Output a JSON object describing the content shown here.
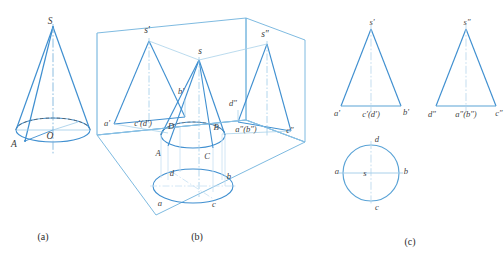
{
  "figure": {
    "colors": {
      "solid_line": "#3f8fd0",
      "light_line": "#9fcbe8",
      "very_light_line": "#c6e0f2",
      "hidden_line": "#6f6f6f",
      "axis_line": "#b9d7ec",
      "label_text": "#3a3a3a",
      "caption_text": "#2b2b2b",
      "background": "#ffffff"
    },
    "captions": [
      {
        "id": "caption-a",
        "label": "(a)",
        "x": 43,
        "y": 238
      },
      {
        "id": "caption-b",
        "label": "(b)",
        "x": 197,
        "y": 238
      },
      {
        "id": "caption-c",
        "label": "(c)",
        "x": 410,
        "y": 243
      }
    ]
  },
  "part_a": {
    "name": "pictorial-cone",
    "labels": [
      {
        "id": "apex-S",
        "text": "S",
        "x": 50,
        "y": 22
      },
      {
        "id": "center-O",
        "text": "O",
        "x": 50,
        "y": 133
      },
      {
        "id": "point-A",
        "text": "A",
        "x": 14,
        "y": 142
      }
    ]
  },
  "part_b": {
    "name": "projection-box",
    "labels": [
      {
        "id": "apex-s-prime",
        "text": "s'",
        "x": 144,
        "y": 29
      },
      {
        "id": "apex-s",
        "text": "s",
        "x": 199,
        "y": 52
      },
      {
        "id": "apex-s-double-prime",
        "text": "s″",
        "x": 262,
        "y": 34
      },
      {
        "id": "label-b-prime",
        "text": "b'",
        "x": 181,
        "y": 92
      },
      {
        "id": "label-d-double-prime",
        "text": "d″",
        "x": 231,
        "y": 103
      },
      {
        "id": "label-a-prime",
        "text": "a'",
        "x": 107,
        "y": 124
      },
      {
        "id": "label-c-prime-d-prime",
        "text": "c'(d')",
        "x": 140,
        "y": 124
      },
      {
        "id": "label-D",
        "text": "D",
        "x": 171,
        "y": 127
      },
      {
        "id": "label-B",
        "text": "B",
        "x": 216,
        "y": 128
      },
      {
        "id": "label-a-dp-b-dp",
        "text": "a″(b″)",
        "x": 228,
        "y": 130
      },
      {
        "id": "label-c-double-prime",
        "text": "c″",
        "x": 287,
        "y": 130
      },
      {
        "id": "label-A",
        "text": "A",
        "x": 158,
        "y": 153
      },
      {
        "id": "label-C",
        "text": "C",
        "x": 206,
        "y": 156
      },
      {
        "id": "label-d",
        "text": "d",
        "x": 172,
        "y": 174
      },
      {
        "id": "label-b",
        "text": "b",
        "x": 228,
        "y": 177
      },
      {
        "id": "label-a",
        "text": "a",
        "x": 160,
        "y": 203
      },
      {
        "id": "label-c",
        "text": "c",
        "x": 213,
        "y": 204
      }
    ]
  },
  "part_c": {
    "name": "three-view-drawing",
    "front_view": {
      "name": "front-view-triangle",
      "labels": [
        {
          "id": "c-apex-s-prime",
          "text": "s'",
          "x": 370,
          "y": 22
        },
        {
          "id": "c-a-prime",
          "text": "a'",
          "x": 337,
          "y": 113
        },
        {
          "id": "c-c-prime-d-prime",
          "text": "c'(d')",
          "x": 369,
          "y": 115
        },
        {
          "id": "c-b-prime",
          "text": "b'",
          "x": 404,
          "y": 112
        }
      ]
    },
    "side_view": {
      "name": "side-view-triangle",
      "labels": [
        {
          "id": "c-apex-s-double-prime",
          "text": "s″",
          "x": 465,
          "y": 22
        },
        {
          "id": "c-d-double-prime",
          "text": "d″",
          "x": 430,
          "y": 114
        },
        {
          "id": "c-a-dp-b-dp",
          "text": "a″(b″)",
          "x": 464,
          "y": 115
        },
        {
          "id": "c-c-double-prime",
          "text": "c″",
          "x": 497,
          "y": 113
        }
      ]
    },
    "top_view": {
      "name": "top-view-circle",
      "labels": [
        {
          "id": "c-d",
          "text": "d",
          "x": 377,
          "y": 140
        },
        {
          "id": "c-a",
          "text": "a",
          "x": 344,
          "y": 172
        },
        {
          "id": "c-s",
          "text": "s",
          "x": 370,
          "y": 173
        },
        {
          "id": "c-b",
          "text": "b",
          "x": 404,
          "y": 172
        },
        {
          "id": "c-c",
          "text": "c",
          "x": 377,
          "y": 206
        }
      ]
    }
  }
}
